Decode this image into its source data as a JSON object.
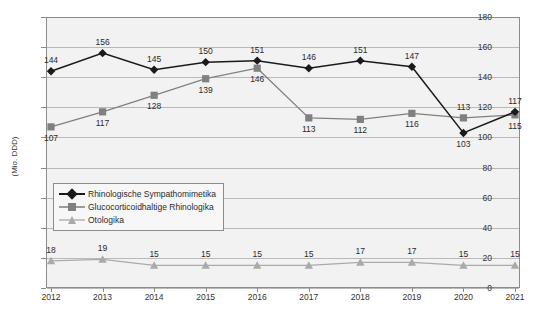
{
  "chart_data": {
    "type": "line",
    "title": "",
    "xlabel": "",
    "ylabel": "(Mio. DDD)",
    "categories": [
      "2012",
      "2013",
      "2014",
      "2015",
      "2016",
      "2017",
      "2018",
      "2019",
      "2020",
      "2021"
    ],
    "ylim": [
      0,
      180
    ],
    "yticks": [
      0,
      20,
      40,
      60,
      80,
      100,
      120,
      140,
      160,
      180
    ],
    "grid": true,
    "legend_position": "inside-left-middle",
    "series": [
      {
        "name": "Rhinologische Sympathomimetika",
        "marker": "diamond",
        "color": "#1a1a1a",
        "values": [
          144,
          156,
          145,
          150,
          151,
          146,
          151,
          147,
          103,
          117
        ],
        "label_positions": [
          "above",
          "above",
          "above",
          "above",
          "above",
          "above",
          "above",
          "above",
          "below",
          "above"
        ]
      },
      {
        "name": "Glucocorticoidhaltige Rhinologika",
        "marker": "square",
        "color": "#808080",
        "values": [
          107,
          117,
          128,
          139,
          146,
          113,
          112,
          116,
          113,
          115
        ],
        "label_positions": [
          "below",
          "below",
          "below",
          "below",
          "below",
          "below",
          "below",
          "below",
          "above",
          "below"
        ]
      },
      {
        "name": "Otologika",
        "marker": "triangle",
        "color": "#aaaaaa",
        "values": [
          18,
          19,
          15,
          15,
          15,
          15,
          17,
          17,
          15,
          15
        ],
        "label_positions": [
          "above",
          "above",
          "above",
          "above",
          "above",
          "above",
          "above",
          "above",
          "above",
          "above"
        ]
      }
    ]
  },
  "colors": {
    "plot_background": "#f2f2f2",
    "gridline": "#b9b9b9",
    "axis": "#8c8c8c",
    "series_1": "#1a1a1a",
    "series_2": "#808080",
    "series_3": "#aaaaaa"
  }
}
